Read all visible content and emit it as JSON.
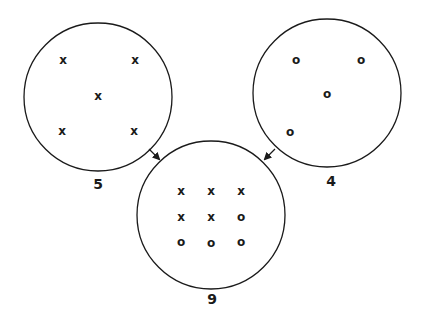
{
  "diagram": {
    "colors": {
      "stroke": "#1a1a1a",
      "background": "#ffffff"
    },
    "sets": [
      {
        "id": "set-x",
        "label": "5",
        "cx": 98,
        "cy": 97,
        "r": 74,
        "label_pos": {
          "x": 98,
          "y": 184
        },
        "members": [
          {
            "symbol": "x",
            "x": 63,
            "y": 60
          },
          {
            "symbol": "x",
            "x": 135,
            "y": 60
          },
          {
            "symbol": "x",
            "x": 98,
            "y": 96
          },
          {
            "symbol": "x",
            "x": 62,
            "y": 131
          },
          {
            "symbol": "x",
            "x": 134,
            "y": 131
          }
        ]
      },
      {
        "id": "set-o",
        "label": "4",
        "cx": 327,
        "cy": 93,
        "r": 74,
        "label_pos": {
          "x": 331,
          "y": 181
        },
        "members": [
          {
            "symbol": "o",
            "x": 296,
            "y": 60
          },
          {
            "symbol": "o",
            "x": 361,
            "y": 60
          },
          {
            "symbol": "o",
            "x": 327,
            "y": 94
          },
          {
            "symbol": "o",
            "x": 290,
            "y": 132
          }
        ]
      },
      {
        "id": "set-union",
        "label": "9",
        "cx": 211,
        "cy": 215,
        "r": 74,
        "label_pos": {
          "x": 212,
          "y": 299
        },
        "members": [
          {
            "symbol": "x",
            "x": 181,
            "y": 191
          },
          {
            "symbol": "x",
            "x": 211,
            "y": 191
          },
          {
            "symbol": "x",
            "x": 241,
            "y": 191
          },
          {
            "symbol": "x",
            "x": 181,
            "y": 217
          },
          {
            "symbol": "x",
            "x": 211,
            "y": 217
          },
          {
            "symbol": "o",
            "x": 241,
            "y": 217
          },
          {
            "symbol": "o",
            "x": 181,
            "y": 242
          },
          {
            "symbol": "o",
            "x": 211,
            "y": 243
          },
          {
            "symbol": "o",
            "x": 241,
            "y": 242
          }
        ]
      }
    ],
    "arrows": [
      {
        "id": "arrow-left-to-union",
        "from": "set-x",
        "to": "set-union",
        "x1": 149,
        "y1": 149,
        "x2": 159,
        "y2": 159
      },
      {
        "id": "arrow-right-to-union",
        "from": "set-o",
        "to": "set-union",
        "x1": 275,
        "y1": 149,
        "x2": 265,
        "y2": 159
      }
    ]
  }
}
